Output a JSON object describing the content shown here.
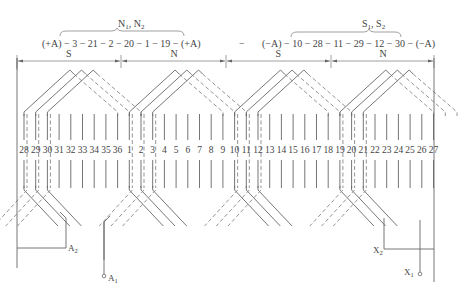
{
  "diagram": {
    "type": "winding-diagram",
    "groups": [
      {
        "label": "N1, N2",
        "sequence": "(+A) − 3 − 21 − 2 − 20 − 1 − 19 −  (+A)"
      },
      {
        "label": "S1, S2",
        "sequence": "(−A)  − 10 − 28 − 11 − 29 − 12 − 30 − (−A)"
      }
    ],
    "separator": "−",
    "poles": [
      "S",
      "N",
      "S",
      "N"
    ],
    "slots": [
      28,
      29,
      30,
      31,
      32,
      33,
      34,
      35,
      36,
      1,
      2,
      3,
      4,
      5,
      6,
      7,
      8,
      9,
      10,
      11,
      12,
      13,
      14,
      15,
      16,
      17,
      18,
      19,
      20,
      21,
      22,
      23,
      24,
      25,
      26,
      27
    ],
    "terminals": {
      "a1": "A1",
      "a2": "A2",
      "x1": "X1",
      "x2": "X2"
    }
  }
}
